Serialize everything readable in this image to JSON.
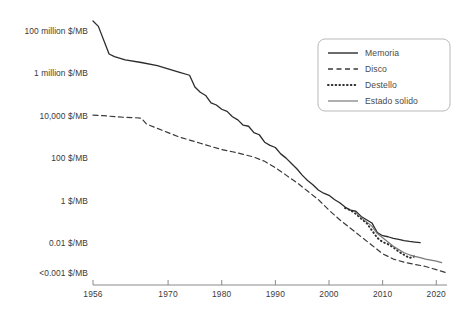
{
  "chart_data": {
    "type": "line",
    "title": "",
    "subtitle": "",
    "xlabel": "",
    "ylabel": "",
    "scale": "log",
    "grid": false,
    "legend_position": "top-right",
    "xlim": [
      1956,
      2022
    ],
    "ylim_log_usd_per_mb": [
      -3.5,
      8.5
    ],
    "x_ticks": [
      1956,
      1970,
      1980,
      1990,
      2000,
      2010,
      2020
    ],
    "x_tick_labels": [
      "1956",
      "1970",
      "1980",
      "1990",
      "2000",
      "2010",
      "2020"
    ],
    "y_ticks_log": [
      8,
      6,
      4,
      2,
      0,
      -2,
      -3.4
    ],
    "y_tick_labels": [
      "100 million $/MB",
      "1 million $/MB",
      "10,000 $/MB",
      "100 $/MB",
      "1 $/MB",
      "0.01 $/MB",
      "<0.001 $/MB"
    ],
    "series": [
      {
        "name": "Memoria",
        "style": "solid",
        "color": "#2b2b2b",
        "width": 1.3,
        "x": [
          1956,
          1957,
          1959,
          1960,
          1962,
          1965,
          1968,
          1970,
          1972,
          1974,
          1975,
          1976,
          1977,
          1978,
          1979,
          1980,
          1981,
          1982,
          1983,
          1984,
          1985,
          1986,
          1987,
          1988,
          1989,
          1990,
          1991,
          1992,
          1993,
          1994,
          1995,
          1996,
          1997,
          1998,
          1999,
          2000,
          2001,
          2002,
          2003,
          2004,
          2005,
          2006,
          2007,
          2008,
          2009,
          2010,
          2011,
          2012,
          2013,
          2014,
          2015,
          2016,
          2017
        ],
        "y_log": [
          8.45,
          8.2,
          6.9,
          6.78,
          6.62,
          6.5,
          6.35,
          6.2,
          6.05,
          5.9,
          5.35,
          5.1,
          4.95,
          4.6,
          4.5,
          4.3,
          4.2,
          3.95,
          3.8,
          3.55,
          3.5,
          3.2,
          3.1,
          2.75,
          2.6,
          2.5,
          2.2,
          2.0,
          1.75,
          1.5,
          1.2,
          0.95,
          0.75,
          0.5,
          0.35,
          0.25,
          0.05,
          -0.1,
          -0.3,
          -0.45,
          -0.5,
          -0.75,
          -0.9,
          -1.05,
          -1.5,
          -1.65,
          -1.7,
          -1.78,
          -1.82,
          -1.88,
          -1.92,
          -1.95,
          -1.98
        ]
      },
      {
        "name": "Disco",
        "style": "dashed",
        "color": "#3a3a3a",
        "width": 1.2,
        "x": [
          1956,
          1958,
          1960,
          1962,
          1964,
          1965,
          1966,
          1968,
          1970,
          1972,
          1974,
          1976,
          1978,
          1980,
          1982,
          1984,
          1986,
          1988,
          1990,
          1992,
          1994,
          1996,
          1998,
          2000,
          2002,
          2004,
          2006,
          2008,
          2010,
          2012,
          2014,
          2016,
          2018,
          2020,
          2022
        ],
        "y_log": [
          4.02,
          4.0,
          3.95,
          3.92,
          3.9,
          3.88,
          3.6,
          3.4,
          3.2,
          3.0,
          2.85,
          2.7,
          2.55,
          2.4,
          2.3,
          2.18,
          2.05,
          1.85,
          1.55,
          1.2,
          0.85,
          0.45,
          0.05,
          -0.45,
          -0.9,
          -1.3,
          -1.7,
          -2.1,
          -2.5,
          -2.75,
          -2.9,
          -3.0,
          -3.1,
          -3.25,
          -3.4
        ]
      },
      {
        "name": "Destello",
        "style": "dotted",
        "color": "#2b2b2b",
        "width": 2.0,
        "x": [
          2003,
          2004,
          2005,
          2006,
          2007,
          2008,
          2009,
          2010,
          2011,
          2012,
          2013,
          2014,
          2015,
          2016
        ],
        "y_log": [
          -0.35,
          -0.45,
          -0.62,
          -0.85,
          -1.05,
          -1.4,
          -1.75,
          -1.95,
          -2.05,
          -2.2,
          -2.4,
          -2.55,
          -2.7,
          -2.62
        ]
      },
      {
        "name": "Estado solido",
        "style": "solid",
        "color": "#7a7a7a",
        "width": 1.2,
        "x": [
          2005,
          2006,
          2007,
          2008,
          2009,
          2010,
          2011,
          2012,
          2013,
          2014,
          2015,
          2016,
          2017,
          2018,
          2019,
          2020,
          2021
        ],
        "y_log": [
          -0.55,
          -0.8,
          -1.0,
          -1.2,
          -1.55,
          -1.75,
          -1.95,
          -2.15,
          -2.3,
          -2.45,
          -2.55,
          -2.62,
          -2.68,
          -2.75,
          -2.8,
          -2.85,
          -2.92
        ]
      }
    ],
    "legend_entries": [
      {
        "label": "Memoria",
        "style": "solid",
        "color": "#2b2b2b"
      },
      {
        "label": "Disco",
        "style": "dashed",
        "color": "#3a3a3a"
      },
      {
        "label": "Destello",
        "style": "dotted",
        "color": "#2b2b2b"
      },
      {
        "label": "Estado solido",
        "style": "solid",
        "color": "#7a7a7a"
      }
    ]
  },
  "colors": {
    "background": "#ffffff",
    "axis": "#8a8a8a",
    "text": "#3a3a3a",
    "legend_border": "#b9b9b9"
  }
}
